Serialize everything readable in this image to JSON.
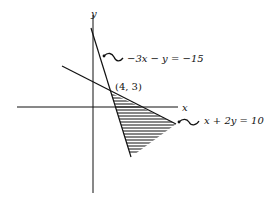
{
  "diagram": {
    "axes": {
      "x_label": "x",
      "y_label": "y"
    },
    "lines": [
      {
        "id": "steep",
        "equation": "−3x − y = −15"
      },
      {
        "id": "shallow",
        "equation": "x + 2y = 10"
      }
    ],
    "intersection_label": "(4, 3)",
    "shaded_region": "triangle below x + 2y = 10 and right of −3x − y = −15",
    "colors": {
      "ink": "#111111",
      "background": "#ffffff"
    }
  }
}
